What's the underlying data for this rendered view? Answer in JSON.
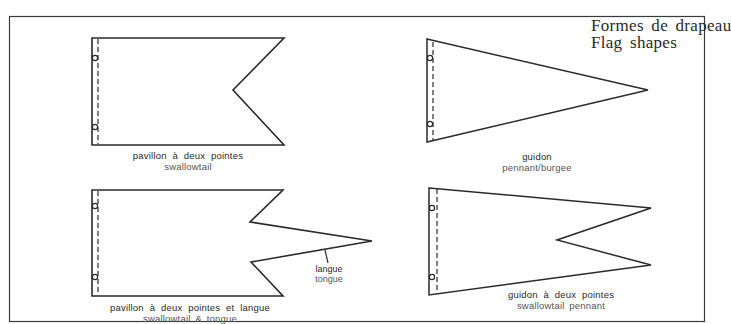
{
  "title": {
    "french": "Formes de drapeau",
    "english": "Flag shapes"
  },
  "colors": {
    "line": "#2a2a2a",
    "background": "#ffffff"
  },
  "flags": [
    {
      "id": "swallowtail",
      "label_fr": "pavillon à deux pointes",
      "label_en": "swallowtail"
    },
    {
      "id": "pennant",
      "label_fr": "guidon",
      "label_en": "pennant/burgee"
    },
    {
      "id": "swallowtail-tongue",
      "label_fr": "pavillon à deux pointes et langue",
      "label_en": "swallowtail & tongue",
      "annotation": {
        "fr": "langue",
        "en": "tongue"
      }
    },
    {
      "id": "swallowtail-pennant",
      "label_fr": "guidon à deux pointes",
      "label_en": "swallowtail pennant"
    }
  ]
}
